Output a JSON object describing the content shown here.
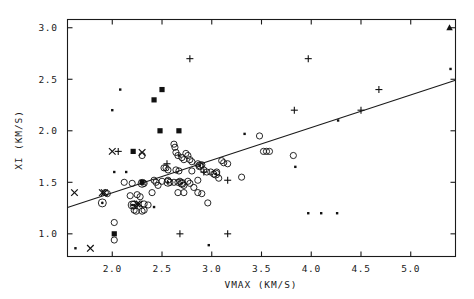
{
  "chart_data": {
    "type": "scatter",
    "title": "",
    "xlabel": "VMAX (KM/S)",
    "ylabel": "XI (KM/S)",
    "xlim": [
      1.55,
      5.45
    ],
    "ylim": [
      0.78,
      3.08
    ],
    "xticks": [
      2.0,
      2.5,
      3.0,
      3.5,
      4.0,
      4.5,
      5.0
    ],
    "xticklabels": [
      "2.0",
      "2.5",
      "3.0",
      "3.5",
      "4.0",
      "4.5",
      "5.0"
    ],
    "yticks": [
      1.0,
      1.5,
      2.0,
      2.5,
      3.0
    ],
    "yticklabels": [
      "1.0",
      "1.5",
      "2.0",
      "2.5",
      "3.0"
    ],
    "grid": false,
    "legend": null,
    "frame": "box",
    "ticks_all_sides": true,
    "fit_line": {
      "type": "linear",
      "x_start": 1.55,
      "y_start": 1.255,
      "x_end": 5.45,
      "y_end": 2.49,
      "slope": 0.3167,
      "intercept": 0.7642
    },
    "marker_kinds": [
      {
        "key": "open_circle",
        "symbol": "open circle"
      },
      {
        "key": "circled_dot",
        "symbol": "circle with center dot"
      },
      {
        "key": "filled_square",
        "symbol": "filled square"
      },
      {
        "key": "small_dot",
        "symbol": "small dot"
      },
      {
        "key": "cross_x",
        "symbol": "x cross"
      },
      {
        "key": "plus",
        "symbol": "plus"
      },
      {
        "key": "triangle",
        "symbol": "filled triangle"
      }
    ],
    "series": [
      {
        "name": "open_circle",
        "points": [
          [
            2.3,
            1.76
          ],
          [
            2.62,
            1.87
          ],
          [
            2.63,
            1.84
          ],
          [
            2.64,
            1.79
          ],
          [
            2.66,
            1.76
          ],
          [
            2.7,
            1.74
          ],
          [
            2.72,
            1.72
          ],
          [
            2.74,
            1.78
          ],
          [
            2.76,
            1.76
          ],
          [
            2.78,
            1.72
          ],
          [
            2.8,
            1.7
          ],
          [
            2.86,
            1.68
          ],
          [
            2.88,
            1.66
          ],
          [
            2.9,
            1.67
          ],
          [
            2.92,
            1.62
          ],
          [
            2.95,
            1.6
          ],
          [
            2.99,
            1.6
          ],
          [
            3.02,
            1.58
          ],
          [
            3.05,
            1.6
          ],
          [
            3.07,
            1.54
          ],
          [
            3.1,
            1.71
          ],
          [
            3.12,
            1.69
          ],
          [
            3.16,
            1.68
          ],
          [
            3.3,
            1.55
          ],
          [
            3.48,
            1.95
          ],
          [
            3.52,
            1.8
          ],
          [
            3.55,
            1.8
          ],
          [
            3.58,
            1.8
          ],
          [
            3.82,
            1.76
          ],
          [
            2.52,
            1.64
          ],
          [
            2.54,
            1.64
          ],
          [
            2.56,
            1.62
          ],
          [
            2.64,
            1.62
          ],
          [
            2.67,
            1.61
          ],
          [
            2.8,
            1.61
          ],
          [
            2.42,
            1.52
          ],
          [
            2.44,
            1.5
          ],
          [
            2.46,
            1.47
          ],
          [
            2.5,
            1.51
          ],
          [
            2.56,
            1.52
          ],
          [
            2.58,
            1.5
          ],
          [
            2.62,
            1.5
          ],
          [
            2.66,
            1.5
          ],
          [
            2.68,
            1.51
          ],
          [
            2.7,
            1.49
          ],
          [
            2.72,
            1.47
          ],
          [
            2.76,
            1.51
          ],
          [
            2.78,
            1.49
          ],
          [
            2.82,
            1.45
          ],
          [
            2.86,
            1.52
          ],
          [
            2.96,
            1.3
          ],
          [
            2.25,
            1.38
          ],
          [
            2.28,
            1.36
          ],
          [
            2.32,
            1.29
          ],
          [
            2.36,
            1.28
          ],
          [
            2.22,
            1.23
          ],
          [
            2.24,
            1.22
          ],
          [
            2.3,
            1.22
          ],
          [
            2.32,
            1.23
          ],
          [
            2.02,
            1.11
          ],
          [
            2.02,
            0.94
          ],
          [
            2.4,
            1.4
          ],
          [
            2.66,
            1.4
          ],
          [
            2.72,
            1.4
          ],
          [
            2.86,
            1.4
          ],
          [
            2.9,
            1.39
          ],
          [
            1.93,
            1.4
          ],
          [
            1.95,
            1.39
          ],
          [
            2.12,
            1.5
          ],
          [
            2.18,
            1.37
          ],
          [
            2.2,
            1.49
          ],
          [
            2.32,
            1.49
          ]
        ]
      },
      {
        "name": "circled_dot",
        "points": [
          [
            1.9,
            1.3
          ],
          [
            2.2,
            1.28
          ],
          [
            2.22,
            1.28
          ],
          [
            2.56,
            1.5
          ],
          [
            2.7,
            1.49
          ],
          [
            2.88,
            1.66
          ],
          [
            3.04,
            1.58
          ],
          [
            2.3,
            1.49
          ]
        ]
      },
      {
        "name": "filled_square",
        "points": [
          [
            2.5,
            2.4
          ],
          [
            2.42,
            2.3
          ],
          [
            2.48,
            2.0
          ],
          [
            2.67,
            2.0
          ],
          [
            2.21,
            1.8
          ],
          [
            2.3,
            1.5
          ],
          [
            2.02,
            1.0
          ]
        ]
      },
      {
        "name": "small_dot",
        "points": [
          [
            2.0,
            2.2
          ],
          [
            2.08,
            2.4
          ],
          [
            2.02,
            1.6
          ],
          [
            2.14,
            1.6
          ],
          [
            1.63,
            0.86
          ],
          [
            2.42,
            1.26
          ],
          [
            2.97,
            0.89
          ],
          [
            3.84,
            1.65
          ],
          [
            3.97,
            1.2
          ],
          [
            4.1,
            1.2
          ],
          [
            4.26,
            1.2
          ],
          [
            4.27,
            2.1
          ],
          [
            3.33,
            1.97
          ],
          [
            5.4,
            2.6
          ],
          [
            2.67,
            1.76
          ]
        ]
      },
      {
        "name": "cross_x",
        "points": [
          [
            1.62,
            1.4
          ],
          [
            1.78,
            0.86
          ],
          [
            1.9,
            1.4
          ],
          [
            1.92,
            1.4
          ],
          [
            2.0,
            1.8
          ],
          [
            2.3,
            1.79
          ],
          [
            2.25,
            1.29
          ],
          [
            2.27,
            1.29
          ]
        ]
      },
      {
        "name": "plus",
        "points": [
          [
            2.06,
            1.8
          ],
          [
            2.55,
            1.68
          ],
          [
            2.78,
            2.7
          ],
          [
            2.68,
            1.0
          ],
          [
            3.16,
            1.0
          ],
          [
            3.16,
            1.52
          ],
          [
            2.92,
            1.6
          ],
          [
            3.97,
            2.7
          ],
          [
            3.83,
            2.2
          ],
          [
            4.5,
            2.2
          ],
          [
            4.68,
            2.4
          ]
        ]
      },
      {
        "name": "triangle",
        "points": [
          [
            5.39,
            3.0
          ]
        ]
      }
    ]
  },
  "axes": {
    "x_title": "VMAX (KM/S)",
    "y_title": "XI (KM/S)"
  }
}
